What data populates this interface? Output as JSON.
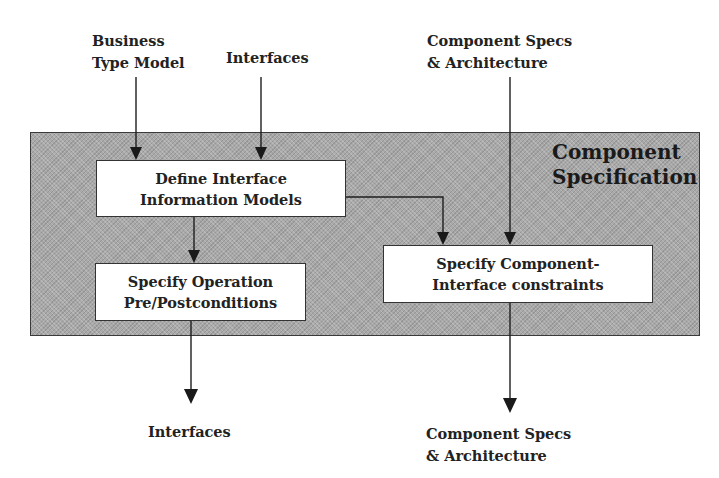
{
  "diagram": {
    "container": {
      "title_line1": "Component",
      "title_line2": "Specification",
      "fill_color": "#a9a9a9"
    },
    "inputs": {
      "business_type_model": {
        "line1": "Business",
        "line2": "Type Model"
      },
      "interfaces": {
        "line1": "Interfaces"
      },
      "component_specs": {
        "line1": "Component Specs",
        "line2": "& Architecture"
      }
    },
    "boxes": {
      "define_interface": {
        "line1": "Define Interface",
        "line2": "Information Models"
      },
      "specify_operation": {
        "line1": "Specify Operation",
        "line2": "Pre/Postconditions"
      },
      "specify_component": {
        "line1": "Specify Component-",
        "line2": "Interface constraints"
      }
    },
    "outputs": {
      "interfaces": {
        "line1": "Interfaces"
      },
      "component_specs": {
        "line1": "Component Specs",
        "line2": "& Architecture"
      }
    },
    "edges": [
      {
        "from": "Business Type Model",
        "to": "Define Interface Information Models"
      },
      {
        "from": "Interfaces",
        "to": "Define Interface Information Models"
      },
      {
        "from": "Component Specs & Architecture",
        "to": "Specify Component-Interface constraints"
      },
      {
        "from": "Define Interface Information Models",
        "to": "Specify Operation Pre/Postconditions"
      },
      {
        "from": "Define Interface Information Models",
        "to": "Specify Component-Interface constraints"
      },
      {
        "from": "Specify Operation Pre/Postconditions",
        "to": "Interfaces"
      },
      {
        "from": "Specify Component-Interface constraints",
        "to": "Component Specs & Architecture"
      }
    ]
  }
}
